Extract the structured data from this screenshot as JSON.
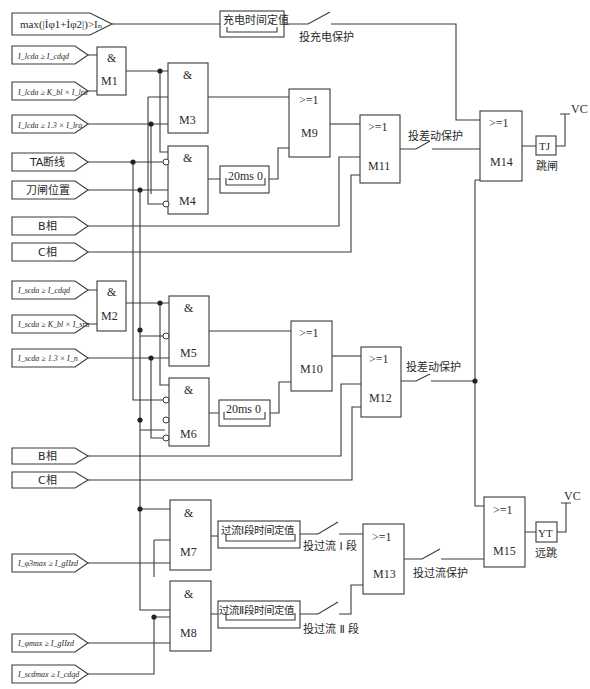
{
  "diagram": {
    "type": "logic-protection-scheme",
    "inputs": {
      "charge": "max(|İφ1+İφ2|)>Iₙ",
      "m1_a": "I_lcda ≥ I_cdqd",
      "m1_b": "I_lcda ≥ K_bl × I_lra",
      "m3_c": "I_lcda ≥ 1.3 × I_lra",
      "ta_break": "TA断线",
      "knife": "刀闸位置",
      "b_phase_1": "B相",
      "c_phase_1": "C相",
      "m2_a": "I_scda ≥ I_cdqd",
      "m2_b": "I_scda ≥ K_bl × I_sra",
      "m5_c": "I_scda ≥ 1.3 × I_n",
      "b_phase_2": "B相",
      "c_phase_2": "C相",
      "oc1": "I_φ3max ≥ I_gIIzd",
      "oc2": "I_φmax ≥ I_gIIzd",
      "oc3": "I_scdmax ≥ I_cdqd"
    },
    "gates": {
      "and_symbol": "&",
      "or_symbol": ">=1",
      "M1": "M1",
      "M2": "M2",
      "M3": "M3",
      "M4": "M4",
      "M5": "M5",
      "M6": "M6",
      "M7": "M7",
      "M8": "M8",
      "M9": "M9",
      "M10": "M10",
      "M11": "M11",
      "M12": "M12",
      "M13": "M13",
      "M14": "M14",
      "M15": "M15"
    },
    "timers": {
      "charge": "充电时间定值",
      "delay1": "20ms  0",
      "delay2": "20ms  0",
      "oc1": "过流Ⅰ段时间定值",
      "oc2": "过流Ⅱ段时间定值"
    },
    "switches": {
      "charge": "投充电保护",
      "diff1": "投差动保护",
      "diff2": "投差动保护",
      "oc1": "投过流 Ⅰ 段",
      "oc2": "投过流 Ⅱ 段",
      "oc": "投过流保护"
    },
    "outputs": {
      "tj": "TJ",
      "tj_label": "跳闸",
      "yt": "YT",
      "yt_label": "远跳",
      "vc1": "VC",
      "vc2": "VC"
    },
    "colors": {
      "line": "#3a3a3a",
      "junction": "#222222",
      "background": "#ffffff"
    }
  }
}
